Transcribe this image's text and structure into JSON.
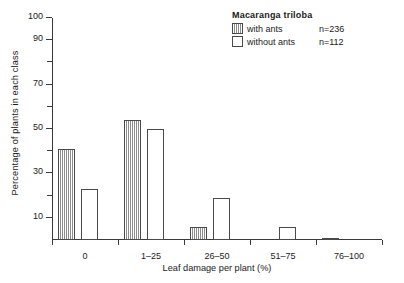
{
  "chart_data": {
    "type": "bar",
    "title": "",
    "xlabel": "Leaf damage per plant (%)",
    "ylabel": "Percentage of plants in each class",
    "categories": [
      "0",
      "1–25",
      "26–50",
      "51–75",
      "76–100"
    ],
    "series": [
      {
        "name": "with ants",
        "n_label": "n=236",
        "fill": "vertical-hatch",
        "values": [
          41,
          54,
          6,
          0,
          1
        ]
      },
      {
        "name": "without ants",
        "n_label": "n=112",
        "fill": "white",
        "values": [
          23,
          50,
          19,
          6,
          0
        ]
      }
    ],
    "ylim": [
      0,
      100
    ],
    "yticks_major": [
      10,
      30,
      50,
      70,
      90,
      100
    ],
    "yticks_minor": [
      20,
      40,
      60,
      80
    ],
    "ytick_labels": [
      "10",
      "30",
      "50",
      "70",
      "90",
      "100"
    ],
    "grid": false,
    "legend_position": "top-right",
    "legend_title": "Macaranga triloba"
  },
  "legend": {
    "title": "Macaranga triloba",
    "entries": [
      {
        "label": "with ants",
        "n": "n=236"
      },
      {
        "label": "without ants",
        "n": "n=112"
      }
    ]
  },
  "axes": {
    "y_title": "Percentage of plants in each class",
    "x_title": "Leaf damage per plant (%)",
    "y_tick_labels": [
      "100",
      "90",
      "70",
      "50",
      "30",
      "10"
    ],
    "x_tick_labels": [
      "0",
      "1–25",
      "26–50",
      "51–75",
      "76–100"
    ]
  }
}
